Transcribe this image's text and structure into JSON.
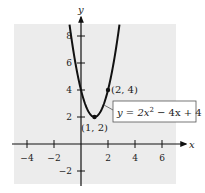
{
  "chart_data": {
    "type": "line",
    "title": "",
    "xlabel": "x",
    "ylabel": "y",
    "xlim": [
      -5.3,
      7.3
    ],
    "ylim": [
      -3.1,
      9.6
    ],
    "x_ticks": [
      -4,
      -2,
      2,
      4,
      6
    ],
    "y_ticks": [
      -2,
      2,
      4,
      6,
      8
    ],
    "grid": false,
    "series": [
      {
        "name": "y = 2x^2 - 4x + 4",
        "equation": {
          "a": 2,
          "b": -4,
          "c": 4
        },
        "x_range": [
          -0.85,
          2.85
        ],
        "color": "#111111"
      }
    ],
    "points": [
      {
        "x": 1,
        "y": 2,
        "label": "(1, 2)",
        "role": "vertex"
      },
      {
        "x": 2,
        "y": 4,
        "label": "(2, 4)"
      }
    ],
    "annotation": {
      "text_prefix": "y = 2x",
      "superscript": "2",
      "text_suffix": " − 4x + 4"
    }
  },
  "colors": {
    "plot_background": "#ececec",
    "axis": "#111111",
    "curve": "#111111",
    "label_box_border": "#555555",
    "label_box_fill": "#ffffff"
  }
}
